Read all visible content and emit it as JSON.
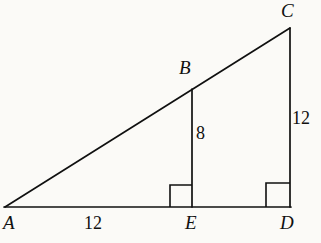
{
  "figure": {
    "type": "geometry-diagram",
    "background_color": "#fbfaf7",
    "stroke_color": "#101010",
    "stroke_width": 1.6,
    "canvas": {
      "width": 321,
      "height": 243
    },
    "points": {
      "A": {
        "x": 5,
        "y": 207
      },
      "B": {
        "x": 192,
        "y": 89
      },
      "C": {
        "x": 290,
        "y": 28
      },
      "D": {
        "x": 290,
        "y": 207
      },
      "E": {
        "x": 192,
        "y": 207
      }
    },
    "segments": [
      {
        "name": "AC-hypotenuse",
        "from": "A",
        "to": "C"
      },
      {
        "name": "AD-base",
        "from": "A",
        "to": "D"
      },
      {
        "name": "CD-side",
        "from": "C",
        "to": "D"
      },
      {
        "name": "BE-altitude",
        "from": "B",
        "to": "E"
      }
    ],
    "right_angles": [
      {
        "name": "right-angle-at-E",
        "vertex": "E",
        "size": 22,
        "direction": "left-up"
      },
      {
        "name": "right-angle-at-D",
        "vertex": "D",
        "size": 24,
        "direction": "left-up"
      }
    ],
    "vertex_labels": [
      {
        "id": "A",
        "text": "A"
      },
      {
        "id": "B",
        "text": "B"
      },
      {
        "id": "C",
        "text": "C"
      },
      {
        "id": "D",
        "text": "D"
      },
      {
        "id": "E",
        "text": "E"
      }
    ],
    "measurements": [
      {
        "id": "AE",
        "segment": "A to E",
        "text": "12",
        "position": "below-base-left"
      },
      {
        "id": "BE",
        "segment": "B to E",
        "text": "8",
        "position": "right-of-altitude"
      },
      {
        "id": "CD",
        "segment": "C to D",
        "text": "12",
        "position": "right-of-side"
      }
    ]
  }
}
